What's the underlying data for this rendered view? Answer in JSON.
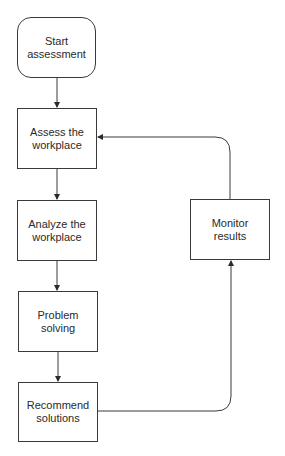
{
  "diagram": {
    "type": "flowchart",
    "colors": {
      "line": "#3a3a3a",
      "text": "#2a2a2a",
      "background": "#ffffff"
    },
    "nodes": [
      {
        "id": "start",
        "label": "Start\nassessment",
        "shape": "rounded-rectangle"
      },
      {
        "id": "assess",
        "label": "Assess the\nworkplace",
        "shape": "rectangle"
      },
      {
        "id": "analyze",
        "label": "Analyze the\nworkplace",
        "shape": "rectangle"
      },
      {
        "id": "problem",
        "label": "Problem solving",
        "shape": "rectangle"
      },
      {
        "id": "recommend",
        "label": "Recommend\nsolutions",
        "shape": "rectangle"
      },
      {
        "id": "monitor",
        "label": "Monitor results",
        "shape": "rectangle"
      }
    ],
    "edges": [
      {
        "from": "start",
        "to": "assess"
      },
      {
        "from": "assess",
        "to": "analyze"
      },
      {
        "from": "analyze",
        "to": "problem"
      },
      {
        "from": "problem",
        "to": "recommend"
      },
      {
        "from": "recommend",
        "to": "monitor"
      },
      {
        "from": "monitor",
        "to": "assess"
      }
    ]
  }
}
